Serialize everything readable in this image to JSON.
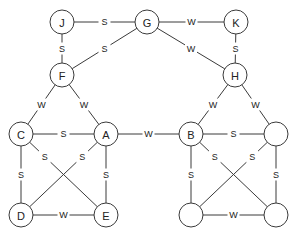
{
  "diagram": {
    "type": "graph",
    "node_radius": 12,
    "nodes": [
      {
        "id": "J",
        "label": "J",
        "x": 62,
        "y": 22
      },
      {
        "id": "G",
        "label": "G",
        "x": 147,
        "y": 22
      },
      {
        "id": "K",
        "label": "K",
        "x": 236,
        "y": 22
      },
      {
        "id": "F",
        "label": "F",
        "x": 62,
        "y": 75
      },
      {
        "id": "H",
        "label": "H",
        "x": 235,
        "y": 75
      },
      {
        "id": "C",
        "label": "C",
        "x": 21,
        "y": 134
      },
      {
        "id": "A",
        "label": "A",
        "x": 106,
        "y": 134
      },
      {
        "id": "B",
        "label": "B",
        "x": 191,
        "y": 134
      },
      {
        "id": "R1",
        "label": "",
        "x": 276,
        "y": 134
      },
      {
        "id": "D",
        "label": "D",
        "x": 21,
        "y": 215
      },
      {
        "id": "E",
        "label": "E",
        "x": 106,
        "y": 215
      },
      {
        "id": "R2",
        "label": "",
        "x": 191,
        "y": 215
      },
      {
        "id": "R3",
        "label": "",
        "x": 276,
        "y": 215
      }
    ],
    "edges": [
      {
        "from": "J",
        "to": "G",
        "label": "S"
      },
      {
        "from": "J",
        "to": "F",
        "label": "S"
      },
      {
        "from": "G",
        "to": "F",
        "label": "S"
      },
      {
        "from": "G",
        "to": "K",
        "label": "W"
      },
      {
        "from": "G",
        "to": "H",
        "label": "W"
      },
      {
        "from": "K",
        "to": "H",
        "label": "S"
      },
      {
        "from": "F",
        "to": "C",
        "label": "W"
      },
      {
        "from": "F",
        "to": "A",
        "label": "W"
      },
      {
        "from": "H",
        "to": "B",
        "label": "W"
      },
      {
        "from": "H",
        "to": "R1",
        "label": "W"
      },
      {
        "from": "C",
        "to": "A",
        "label": "S"
      },
      {
        "from": "C",
        "to": "D",
        "label": "S"
      },
      {
        "from": "C",
        "to": "E",
        "label": "S",
        "label_t": 0.28
      },
      {
        "from": "A",
        "to": "D",
        "label": "S",
        "label_t": 0.28
      },
      {
        "from": "A",
        "to": "E",
        "label": "S"
      },
      {
        "from": "D",
        "to": "E",
        "label": "W"
      },
      {
        "from": "A",
        "to": "B",
        "label": "W"
      },
      {
        "from": "B",
        "to": "R1",
        "label": "S"
      },
      {
        "from": "B",
        "to": "R2",
        "label": "S"
      },
      {
        "from": "B",
        "to": "R3",
        "label": "S",
        "label_t": 0.28
      },
      {
        "from": "R1",
        "to": "R2",
        "label": "S",
        "label_t": 0.28
      },
      {
        "from": "R1",
        "to": "R3",
        "label": "S"
      },
      {
        "from": "R2",
        "to": "R3",
        "label": "W"
      }
    ]
  }
}
